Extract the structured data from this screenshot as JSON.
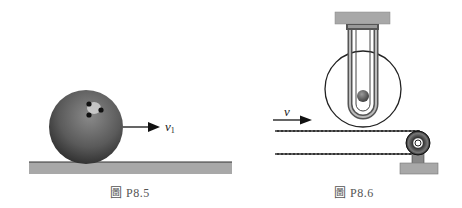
{
  "figures": [
    {
      "id": "P8.5",
      "caption": "圖 P8.5",
      "description": "Bowling ball rolling on a horizontal surface with velocity arrow",
      "velocity_label": "v",
      "velocity_subscript": "1"
    },
    {
      "id": "P8.6",
      "caption": "圖 P8.6",
      "description": "Disk with U-tube containing a ball, mounted on support above a belt moving over a pulley",
      "velocity_label": "v"
    }
  ],
  "colors": {
    "ball": "#5a5a5a",
    "ground": "#a8a8a8",
    "line": "#222222",
    "background": "#ffffff"
  }
}
